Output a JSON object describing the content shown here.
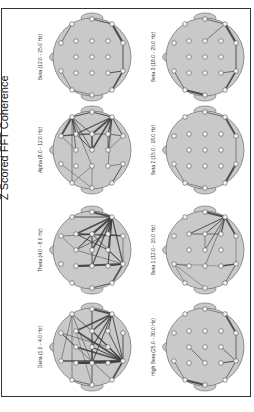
{
  "figure": {
    "title": "Z Scored FFT Coherence",
    "orientation": "rotated 90° counter-clockwise"
  },
  "electrodes": {
    "Fp1": [
      -31,
      -14
    ],
    "Fp2": [
      -31,
      14
    ],
    "F7": [
      -20,
      -33
    ],
    "F3": [
      -16,
      -16
    ],
    "Fz": [
      -16,
      0
    ],
    "F4": [
      -16,
      16
    ],
    "F8": [
      -20,
      33
    ],
    "T3": [
      0,
      -38
    ],
    "C3": [
      0,
      -16
    ],
    "Cz": [
      0,
      0
    ],
    "C4": [
      0,
      16
    ],
    "T4": [
      0,
      38
    ],
    "T5": [
      20,
      -33
    ],
    "P3": [
      16,
      -16
    ],
    "Pz": [
      16,
      0
    ],
    "P4": [
      16,
      16
    ],
    "T6": [
      20,
      33
    ],
    "O1": [
      31,
      -14
    ],
    "O2": [
      31,
      14
    ]
  },
  "panels": [
    {
      "id": "beta",
      "label": "Beta (12.0 - 25.0 Hz)",
      "cx": 92,
      "cy": 57,
      "links": [
        [
          "T3",
          "T5",
          1.0
        ],
        [
          "T5",
          "O1",
          2.2
        ],
        [
          "F7",
          "Fp1",
          0.8
        ],
        [
          "F8",
          "T4",
          0.6
        ],
        [
          "T6",
          "O2",
          1.5
        ],
        [
          "O2",
          "P4",
          1.0
        ],
        [
          "O2",
          "O1",
          1.0
        ],
        [
          "F8",
          "Fp2",
          0.6
        ]
      ]
    },
    {
      "id": "beta3",
      "label": "Beta 3 (18.0 - 25.0 Hz)",
      "cx": 205,
      "cy": 57,
      "links": [
        [
          "T3",
          "T5",
          0.8
        ],
        [
          "T5",
          "C3",
          0.7
        ],
        [
          "T5",
          "O1",
          2.2
        ],
        [
          "Fp2",
          "F8",
          0.8
        ],
        [
          "F8",
          "T4",
          2.0
        ],
        [
          "T6",
          "O2",
          1.5
        ],
        [
          "O2",
          "O1",
          1.0
        ],
        [
          "O2",
          "P4",
          0.8
        ]
      ]
    },
    {
      "id": "alpha",
      "label": "Alpha (8.0 - 12.0 Hz)",
      "cx": 92,
      "cy": 150,
      "links": [
        [
          "F7",
          "Fp1",
          2.0
        ],
        [
          "F7",
          "F3",
          1.2
        ],
        [
          "F7",
          "Fz",
          0.8
        ],
        [
          "F7",
          "C3",
          0.8
        ],
        [
          "F7",
          "Cz",
          0.8
        ],
        [
          "F7",
          "F8",
          0.6
        ],
        [
          "F7",
          "C4",
          0.6
        ],
        [
          "Fp1",
          "F3",
          0.8
        ],
        [
          "Fp1",
          "C3",
          0.8
        ],
        [
          "Fp1",
          "Fz",
          0.6
        ],
        [
          "T3",
          "T5",
          1.0
        ],
        [
          "T3",
          "F7",
          1.0
        ],
        [
          "T5",
          "C3",
          2.0
        ],
        [
          "T5",
          "Cz",
          1.6
        ],
        [
          "T5",
          "F3",
          1.2
        ],
        [
          "T5",
          "P3",
          1.2
        ],
        [
          "T5",
          "Pz",
          0.8
        ],
        [
          "T5",
          "P4",
          0.6
        ],
        [
          "T5",
          "O1",
          1.0
        ],
        [
          "C3",
          "Cz",
          1.6
        ],
        [
          "F3",
          "Cz",
          1.0
        ],
        [
          "F3",
          "P3",
          0.8
        ],
        [
          "P3",
          "Pz",
          0.8
        ],
        [
          "O1",
          "P3",
          0.8
        ],
        [
          "O1",
          "Pz",
          0.6
        ],
        [
          "T6",
          "O2",
          1.0
        ],
        [
          "T4",
          "Fp2",
          0.5
        ],
        [
          "T4",
          "C4",
          0.5
        ],
        [
          "F8",
          "C4",
          0.5
        ],
        [
          "P4",
          "O2",
          0.6
        ]
      ]
    },
    {
      "id": "beta2",
      "label": "Beta 2 (15.0 - 18.0 Hz)",
      "cx": 205,
      "cy": 150,
      "links": [
        [
          "T3",
          "T5",
          0.8
        ],
        [
          "T5",
          "O1",
          1.8
        ],
        [
          "Fp2",
          "F8",
          0.6
        ],
        [
          "F8",
          "T4",
          0.6
        ],
        [
          "T6",
          "O2",
          2.0
        ],
        [
          "O2",
          "O1",
          0.6
        ]
      ]
    },
    {
      "id": "theta",
      "label": "Theta (4.0 - 8.0 Hz)",
      "cx": 92,
      "cy": 250,
      "links": [
        [
          "T3",
          "T5",
          2.0
        ],
        [
          "T5",
          "F3",
          1.6
        ],
        [
          "T5",
          "C3",
          2.0
        ],
        [
          "T5",
          "Cz",
          1.6
        ],
        [
          "T5",
          "C4",
          1.2
        ],
        [
          "T5",
          "P3",
          1.6
        ],
        [
          "T5",
          "Pz",
          1.2
        ],
        [
          "T5",
          "P4",
          1.2
        ],
        [
          "T5",
          "O2",
          1.2
        ],
        [
          "T5",
          "F7",
          1.0
        ],
        [
          "T5",
          "Fz",
          0.8
        ],
        [
          "F3",
          "C3",
          1.2
        ],
        [
          "F3",
          "Pz",
          1.0
        ],
        [
          "F3",
          "O1",
          1.0
        ],
        [
          "C3",
          "Cz",
          1.2
        ],
        [
          "Cz",
          "C4",
          1.0
        ],
        [
          "Fz",
          "C3",
          0.8
        ],
        [
          "Fz",
          "P3",
          0.8
        ],
        [
          "Fz",
          "O2",
          0.6
        ],
        [
          "Fp1",
          "P3",
          0.6
        ],
        [
          "Fp1",
          "Fz",
          0.5
        ],
        [
          "F4",
          "C4",
          1.0
        ],
        [
          "F4",
          "O2",
          2.0
        ],
        [
          "T4",
          "T6",
          1.0
        ],
        [
          "T6",
          "O2",
          1.6
        ],
        [
          "O2",
          "P4",
          1.2
        ],
        [
          "O2",
          "Pz",
          1.0
        ],
        [
          "O2",
          "C3",
          0.8
        ],
        [
          "O1",
          "P3",
          0.8
        ],
        [
          "O1",
          "O2",
          0.6
        ]
      ]
    },
    {
      "id": "beta1",
      "label": "Beta 1 (12.0 - 15.0 Hz)",
      "cx": 205,
      "cy": 250,
      "links": [
        [
          "T3",
          "T5",
          2.2
        ],
        [
          "T5",
          "F3",
          1.0
        ],
        [
          "T5",
          "C3",
          1.0
        ],
        [
          "T5",
          "Cz",
          0.8
        ],
        [
          "T5",
          "C4",
          0.6
        ],
        [
          "T5",
          "P3",
          1.2
        ],
        [
          "T5",
          "O1",
          1.6
        ],
        [
          "F3",
          "P3",
          0.8
        ],
        [
          "C3",
          "Cz",
          0.6
        ],
        [
          "Fp2",
          "F4",
          0.6
        ],
        [
          "Fp2",
          "F8",
          0.5
        ],
        [
          "Fp2",
          "T4",
          0.5
        ],
        [
          "Fp2",
          "P4",
          0.4
        ],
        [
          "P4",
          "O2",
          1.4
        ],
        [
          "T6",
          "O2",
          0.8
        ],
        [
          "O2",
          "O1",
          0.5
        ]
      ]
    },
    {
      "id": "delta",
      "label": "Delta (1.0 - 4.0 Hz)",
      "cx": 92,
      "cy": 347,
      "links": [
        [
          "T3",
          "T5",
          2.0
        ],
        [
          "T5",
          "F3",
          1.6
        ],
        [
          "T5",
          "C3",
          1.6
        ],
        [
          "T5",
          "Cz",
          1.2
        ],
        [
          "T5",
          "C4",
          1.0
        ],
        [
          "T5",
          "P3",
          1.0
        ],
        [
          "T5",
          "O2",
          1.0
        ],
        [
          "O2",
          "F3",
          1.6
        ],
        [
          "O2",
          "Fz",
          1.6
        ],
        [
          "O2",
          "F4",
          2.0
        ],
        [
          "O2",
          "C3",
          1.4
        ],
        [
          "O2",
          "Cz",
          1.2
        ],
        [
          "O2",
          "P3",
          1.0
        ],
        [
          "O2",
          "P4",
          1.6
        ],
        [
          "O2",
          "T6",
          1.6
        ],
        [
          "O2",
          "Pz",
          1.0
        ],
        [
          "O2",
          "O1",
          1.0
        ],
        [
          "O2",
          "Fp2",
          1.4
        ],
        [
          "F4",
          "C4",
          1.6
        ],
        [
          "F4",
          "P4",
          1.2
        ],
        [
          "F7",
          "Fp2",
          0.6
        ],
        [
          "F7",
          "C4",
          0.6
        ],
        [
          "F7",
          "F8",
          0.6
        ],
        [
          "Fp1",
          "Fz",
          0.8
        ],
        [
          "Fp1",
          "T6",
          0.6
        ],
        [
          "Fp1",
          "Pz",
          0.6
        ],
        [
          "F3",
          "T4",
          0.5
        ],
        [
          "C3",
          "T4",
          0.5
        ],
        [
          "Cz",
          "C4",
          0.8
        ],
        [
          "F8",
          "T4",
          0.8
        ],
        [
          "T3",
          "C4",
          0.6
        ],
        [
          "T3",
          "T4",
          0.5
        ],
        [
          "F7",
          "C3",
          0.8
        ]
      ]
    },
    {
      "id": "highbeta",
      "label": "High Beta (25.0 - 30.0 Hz)",
      "cx": 205,
      "cy": 347,
      "links": [
        [
          "T3",
          "T5",
          0.6
        ],
        [
          "T5",
          "O1",
          1.8
        ],
        [
          "Fp2",
          "F8",
          0.6
        ],
        [
          "F8",
          "T4",
          2.0
        ],
        [
          "Fz",
          "C4",
          0.8
        ],
        [
          "P4",
          "O2",
          1.2
        ],
        [
          "O2",
          "T6",
          0.8
        ],
        [
          "O2",
          "Pz",
          0.8
        ],
        [
          "O2",
          "O1",
          0.8
        ]
      ]
    }
  ],
  "colors": {
    "head_fill": "#c9c9c9",
    "head_stroke": "#777777",
    "electrode_fill": "#f4f4f4",
    "electrode_stroke": "#555555",
    "link": "#3a3a3a",
    "frame": "#333333"
  }
}
